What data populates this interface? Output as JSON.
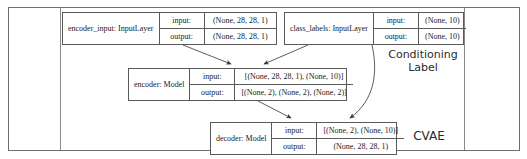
{
  "diagram": {
    "frame": {
      "present": true,
      "divider_left": true,
      "divider_right": true
    },
    "nodes": [
      {
        "id": "encoder_input",
        "name": "encoder_input: InputLayer",
        "rows": [
          {
            "key": "input:",
            "value": "(None, 28, 28, 1)"
          },
          {
            "key": "output:",
            "value": "(None, 28, 28, 1)"
          }
        ]
      },
      {
        "id": "class_labels",
        "name": "class_labels: InputLayer",
        "rows": [
          {
            "key": "input:",
            "value": "(None, 10)"
          },
          {
            "key": "output:",
            "value": "(None, 10)"
          }
        ]
      },
      {
        "id": "encoder",
        "name": "encoder: Model",
        "rows": [
          {
            "key": "input:",
            "value": "[(None, 28, 28, 1), (None, 10)]"
          },
          {
            "key": "output:",
            "value": "[(None, 2), (None, 2), (None, 2)]"
          }
        ]
      },
      {
        "id": "decoder",
        "name": "decoder: Model",
        "rows": [
          {
            "key": "input:",
            "value": "[(None, 2), (None, 10)]"
          },
          {
            "key": "output:",
            "value": "(None, 28, 28, 1)"
          }
        ]
      }
    ],
    "annotations": [
      {
        "id": "conditioning",
        "text": "Conditioning\nLabel"
      },
      {
        "id": "cvae",
        "text": "CVAE"
      }
    ],
    "edges": [
      {
        "from": "encoder_input",
        "to": "encoder"
      },
      {
        "from": "class_labels",
        "to": "encoder"
      },
      {
        "from": "class_labels",
        "to": "decoder"
      },
      {
        "from": "encoder",
        "to": "decoder"
      }
    ],
    "colors": {
      "box_border": "#5a5a5a",
      "frame_border": "#6f6f6f",
      "edge": "#4a4a4a",
      "text": "#1a1a1a",
      "background": "#ffffff"
    }
  }
}
